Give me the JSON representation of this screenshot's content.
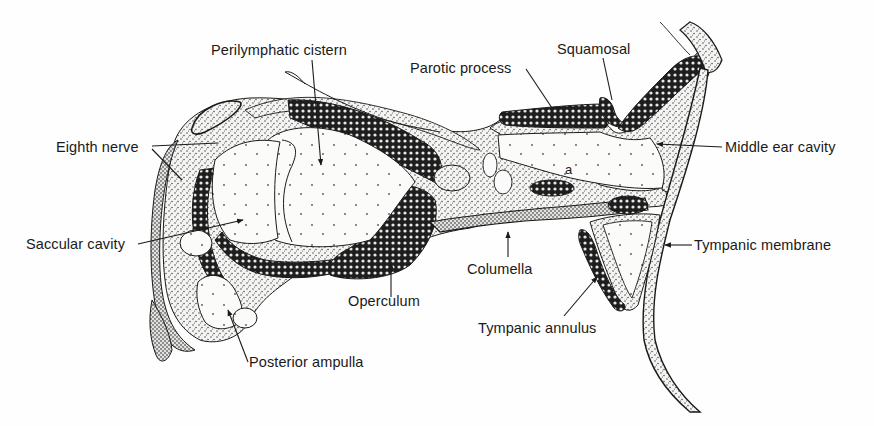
{
  "figure": {
    "colors": {
      "ink": "#1a1a1a",
      "bone_fill": "#2a2a2a",
      "stipple": "#3a3a3a",
      "background": "#fefefe"
    }
  },
  "labels": {
    "perilymphatic_cistern": "Perilymphatic cistern",
    "parotic_process": "Parotic process",
    "squamosal": "Squamosal",
    "eighth_nerve": "Eighth nerve",
    "middle_ear_cavity": "Middle ear cavity",
    "a": "a",
    "saccular_cavity": "Saccular cavity",
    "tympanic_membrane": "Tympanic membrane",
    "columella": "Columella",
    "operculum": "Operculum",
    "tympanic_annulus": "Tympanic annulus",
    "posterior_ampulla": "Posterior ampulla"
  }
}
